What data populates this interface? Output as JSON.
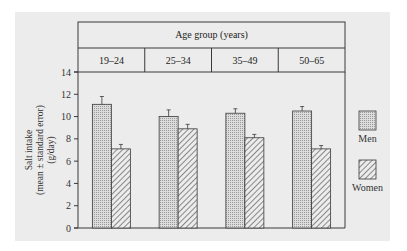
{
  "chart_data": {
    "type": "bar",
    "title": "Age group (years)",
    "categories": [
      "19–24",
      "25–34",
      "35–49",
      "50–65"
    ],
    "series": [
      {
        "name": "Men",
        "pattern": "dots",
        "values": [
          11.1,
          10.0,
          10.3,
          10.5
        ],
        "errors": [
          0.7,
          0.6,
          0.4,
          0.4
        ]
      },
      {
        "name": "Women",
        "pattern": "hatch",
        "values": [
          7.1,
          8.9,
          8.1,
          7.1
        ],
        "errors": [
          0.4,
          0.4,
          0.3,
          0.3
        ]
      }
    ],
    "xlabel": "",
    "ylabel_lines": [
      "Salt intake",
      "(mean ± standard error)",
      "(g/day)"
    ],
    "yticks": [
      0,
      2,
      4,
      6,
      8,
      10,
      12,
      14
    ],
    "ylim": [
      0,
      14
    ],
    "grid": false,
    "legend_position": "right"
  },
  "colors": {
    "panel_bg": "#ececec",
    "bar_fill": "#d9d9d9",
    "stroke": "#3a3a3a"
  }
}
